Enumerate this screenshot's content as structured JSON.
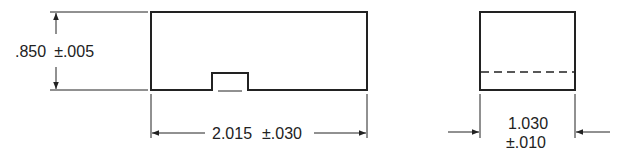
{
  "drawing": {
    "front_view": {
      "height_dim": {
        "value": ".850",
        "tolerance": "±.005"
      },
      "width_dim": {
        "value": "2.015",
        "tolerance": "±.030"
      }
    },
    "side_view": {
      "width_dim": {
        "value": "1.030",
        "tolerance": "±.010"
      }
    },
    "colors": {
      "line": "#222222",
      "background": "#ffffff"
    }
  }
}
